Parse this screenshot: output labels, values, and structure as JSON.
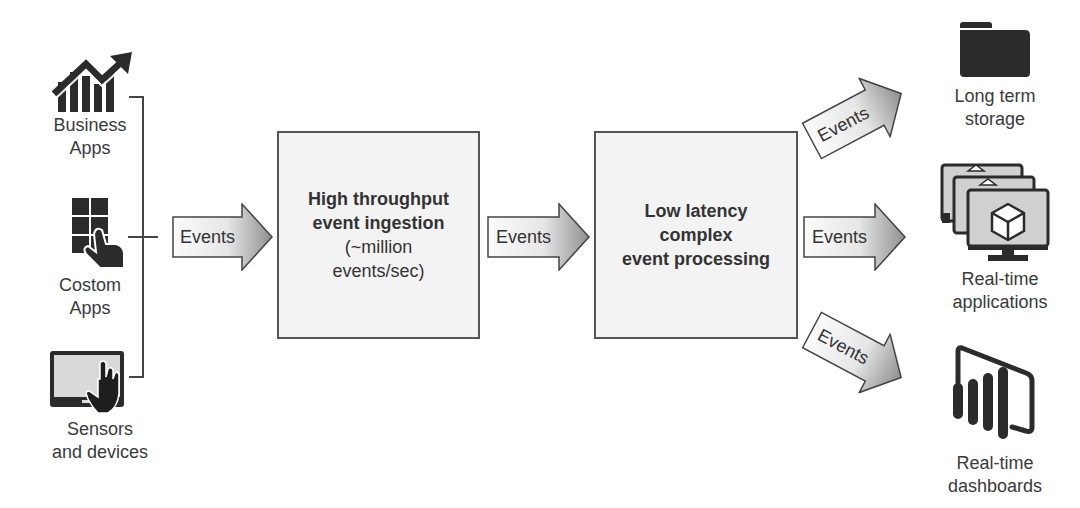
{
  "sources": [
    {
      "id": "business-apps",
      "label_lines": [
        "Business",
        "Apps"
      ],
      "icon": "growth-chart-icon"
    },
    {
      "id": "custom-apps",
      "label_lines": [
        "Costom",
        "Apps"
      ],
      "icon": "touch-grid-icon"
    },
    {
      "id": "sensors",
      "label_lines": [
        "Sensors",
        "and devices"
      ],
      "icon": "tablet-touch-icon"
    }
  ],
  "arrows": {
    "a1": "Events",
    "a2": "Events",
    "out_top": "Events",
    "out_mid": "Events",
    "out_bottom": "Events"
  },
  "ingestion": {
    "title_lines": [
      "High throughput",
      "event ingestion"
    ],
    "sub_lines": [
      "(~million",
      "events/sec)"
    ]
  },
  "processing": {
    "title_lines": [
      "Low latency",
      "complex",
      "event processing"
    ]
  },
  "destinations": [
    {
      "id": "storage",
      "label_lines": [
        "Long term",
        "storage"
      ],
      "icon": "folder-icon"
    },
    {
      "id": "applications",
      "label_lines": [
        "Real-time",
        "applications"
      ],
      "icon": "stacked-monitors-icon"
    },
    {
      "id": "dashboards",
      "label_lines": [
        "Real-time",
        "dashboards"
      ],
      "icon": "power-bi-dashboard-icon"
    }
  ],
  "colors": {
    "box_fill": "#f3f3f3",
    "stroke": "#555555",
    "icon_dark": "#2b2b2b",
    "arrow_light": "#fafafa",
    "arrow_dark": "#9a9a9a"
  }
}
